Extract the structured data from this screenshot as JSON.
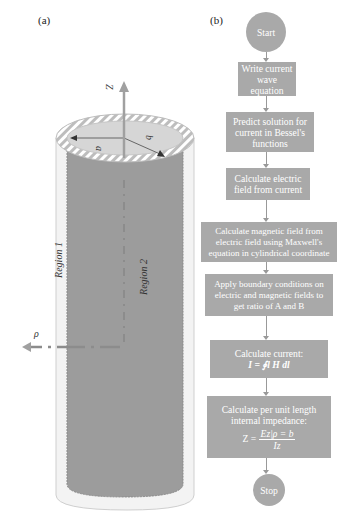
{
  "panels": {
    "a": {
      "label": "(a)",
      "axis_z": "Z",
      "axis_rho": "ρ",
      "radius_inner": "a",
      "radius_outer": "b",
      "region_outer": "Region 1",
      "region_inner": "Region 2"
    },
    "b": {
      "label": "(b)",
      "flowchart": {
        "start": "Start",
        "steps": [
          {
            "line1": "Write current",
            "line2": "wave equation"
          },
          {
            "line1": "Predict solution for",
            "line2": "current in Bessel's",
            "line3": "functions"
          },
          {
            "line1": "Calculate electric",
            "line2": "field from current"
          },
          {
            "line1": "Calculate magnetic field from",
            "line2": "electric field using Maxwell's",
            "line3": "equation in cylindrical coordinate"
          },
          {
            "line1": "Apply boundary conditions on",
            "line2": "electric and magnetic fields to",
            "line3": "get ratio of A and B"
          },
          {
            "line1": "Calculate current:",
            "equation": "I = ∮l H dl"
          },
          {
            "line1": "Calculate per unit length",
            "line2": "internal impedance:",
            "eq_lhs": "Z =",
            "eq_num": "Ez|ρ = b",
            "eq_den": "Iz"
          }
        ],
        "stop": "Stop"
      }
    }
  },
  "colors": {
    "node_fill": "#a9a9a9",
    "node_text": "#ffffff",
    "connector": "#999999",
    "core_fill": "#9a9a9a",
    "shell_fill": "#f2f2f2",
    "axis_color": "#a0a0a0"
  }
}
